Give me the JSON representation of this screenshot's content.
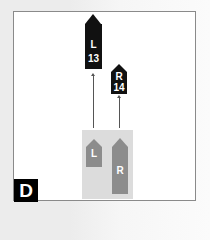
{
  "diagram": {
    "panel_label": "D",
    "colors": {
      "final_boat": "#111111",
      "start_boat": "#8c8c8c",
      "start_zone": "#dcdcdc",
      "arrow": "#555555",
      "frame": "#8a8a8a"
    },
    "final_positions": [
      {
        "side": "L",
        "number": "13"
      },
      {
        "side": "R",
        "number": "14"
      }
    ],
    "start_positions": [
      {
        "side": "L"
      },
      {
        "side": "R"
      }
    ]
  }
}
